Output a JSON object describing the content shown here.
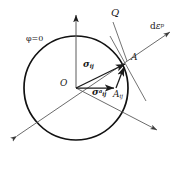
{
  "figure": {
    "stroke_color": "#1a1a1a",
    "background": "#ffffff",
    "thin_color": "#4a4a4a"
  },
  "labels": {
    "yield_surface": "φ=0",
    "q_axis": "Q",
    "plastic_strain_increment_d": "d",
    "plastic_strain_increment_eps": "ε",
    "plastic_strain_increment_sup": "p",
    "point_a": "A",
    "origin": "O",
    "stress_sigma": "σ",
    "stress_sub": "ij",
    "backstress_sigma": "σ",
    "backstress_sub": "ij",
    "backstress_sup": "a",
    "a_tensor": "A",
    "a_tensor_sub": "ij"
  },
  "geometry": {
    "circle": {
      "cx": 76,
      "cy": 88,
      "r": 52
    },
    "origin": {
      "x": 76,
      "y": 88
    },
    "point_a": {
      "x": 126,
      "y": 63
    },
    "point_aij": {
      "x": 116,
      "y": 88
    },
    "q_axis_tip": {
      "x": 76,
      "y": 12
    },
    "deps_arrow_tip": {
      "x": 172,
      "y": 31
    },
    "axis_lower_left_tip": {
      "x": 13,
      "y": 139
    },
    "axis_lower_right_tip": {
      "x": 160,
      "y": 132
    }
  }
}
